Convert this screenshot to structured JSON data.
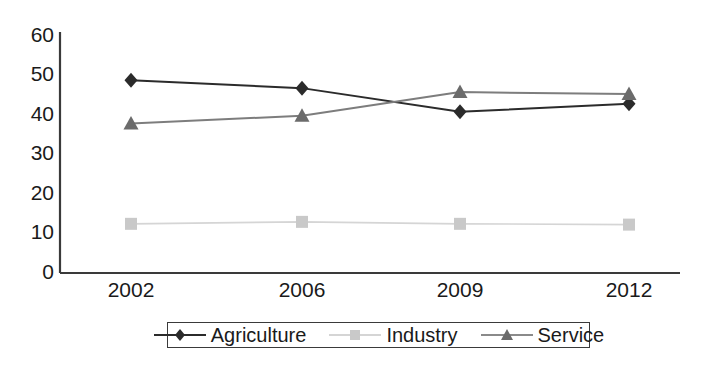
{
  "chart_data": {
    "type": "line",
    "title": "",
    "xlabel": "",
    "ylabel": "",
    "categories": [
      "2002",
      "2006",
      "2009",
      "2012"
    ],
    "ylim": [
      0,
      60
    ],
    "yticks": [
      0,
      10,
      20,
      30,
      40,
      50,
      60
    ],
    "ytick_labels": [
      "0",
      "10",
      "20",
      "30",
      "40",
      "50",
      "60"
    ],
    "grid": false,
    "legend_position": "bottom",
    "series": [
      {
        "name": "Agriculture",
        "marker": "diamond",
        "color": "#2b2b2b",
        "values": [
          49,
          47,
          41,
          43
        ]
      },
      {
        "name": "Industry",
        "marker": "square",
        "color": "#c9c9c9",
        "values": [
          12.5,
          13,
          12.5,
          12.3
        ]
      },
      {
        "name": "Service",
        "marker": "triangle",
        "color": "#6b6b6b",
        "values": [
          38,
          40,
          46,
          45.5
        ]
      }
    ]
  },
  "axes": {
    "y_tick_0": "0",
    "y_tick_1": "10",
    "y_tick_2": "20",
    "y_tick_3": "30",
    "y_tick_4": "40",
    "y_tick_5": "50",
    "y_tick_6": "60",
    "x_tick_0": "2002",
    "x_tick_1": "2006",
    "x_tick_2": "2009",
    "x_tick_3": "2012"
  },
  "legend": {
    "items": [
      {
        "label": "Agriculture",
        "marker": "diamond-marker-icon",
        "color": "#2b2b2b"
      },
      {
        "label": "Industry",
        "marker": "square-marker-icon",
        "color": "#c9c9c9"
      },
      {
        "label": "Service",
        "marker": "triangle-marker-icon",
        "color": "#6b6b6b"
      }
    ]
  },
  "colors": {
    "axis": "#3a3a3a",
    "text": "#1a1a1a",
    "background": "#ffffff"
  }
}
